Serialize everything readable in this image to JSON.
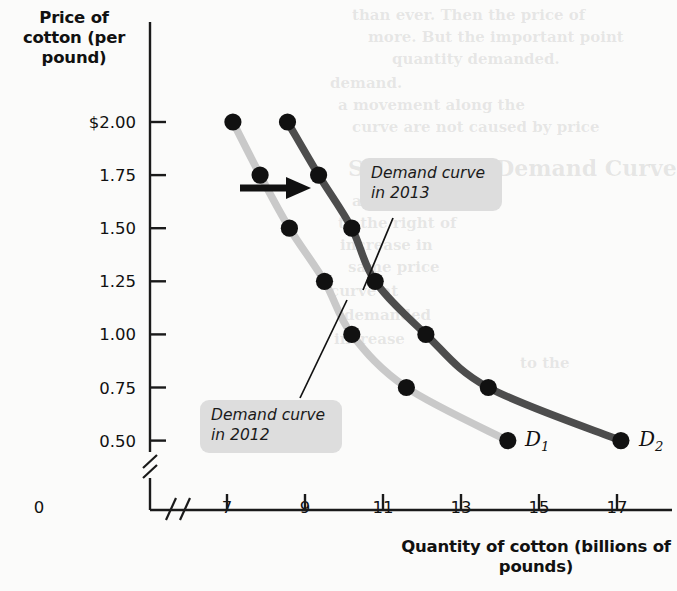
{
  "figure": {
    "y_axis_title": "Price of\ncotton\n(per pound)",
    "x_axis_title": "Quantity of cotton\n(billions of pounds)",
    "origin_label": "0"
  },
  "callouts": {
    "d2_label": "Demand curve\nin 2013",
    "d1_label": "Demand curve\nin 2012"
  },
  "curve_names": {
    "d1": "D",
    "d1_sub": "1",
    "d2": "D",
    "d2_sub": "2"
  },
  "colors": {
    "curve_2012": "#c9c9c9",
    "curve_2013": "#4d4d4d",
    "point": "#111111",
    "callout_bg": "#dddddd",
    "axis": "#1a1a1a",
    "page_bg": "#fbfbfa"
  },
  "ghost_text": [
    {
      "text": "than ever. Then the price of",
      "x": 352,
      "y": 6,
      "size": 15
    },
    {
      "text": "more. But the important point",
      "x": 368,
      "y": 28,
      "size": 15
    },
    {
      "text": "quantity demanded.",
      "x": 392,
      "y": 50,
      "size": 15
    },
    {
      "text": "demand.",
      "x": 330,
      "y": 74,
      "size": 15
    },
    {
      "text": "a movement along the",
      "x": 338,
      "y": 96,
      "size": 15
    },
    {
      "text": "curve are not caused by price",
      "x": 352,
      "y": 118,
      "size": 15
    },
    {
      "text": "Shift of the Demand Curve",
      "x": 348,
      "y": 155,
      "size": 22
    },
    {
      "text": "and the demand",
      "x": 352,
      "y": 192,
      "size": 15
    },
    {
      "text": "to the right of",
      "x": 338,
      "y": 214,
      "size": 15
    },
    {
      "text": "increase in",
      "x": 340,
      "y": 236,
      "size": 15
    },
    {
      "text": "same price",
      "x": 348,
      "y": 258,
      "size": 15
    },
    {
      "text": "curve at",
      "x": 330,
      "y": 282,
      "size": 15
    },
    {
      "text": "demanded",
      "x": 344,
      "y": 306,
      "size": 15
    },
    {
      "text": "increase",
      "x": 334,
      "y": 330,
      "size": 15
    },
    {
      "text": "to the",
      "x": 520,
      "y": 354,
      "size": 15
    }
  ],
  "chart_data": {
    "type": "line",
    "title": "",
    "xlabel": "Quantity of cotton (billions of pounds)",
    "ylabel": "Price of cotton (per pound)",
    "xlim": [
      6.3,
      17.8
    ],
    "ylim": [
      0.5,
      2.0
    ],
    "xticks": [
      7,
      9,
      11,
      13,
      15,
      17
    ],
    "xticklabels": [
      "7",
      "9",
      "11",
      "13",
      "15",
      "17"
    ],
    "yticks": [
      0.5,
      0.75,
      1.0,
      1.25,
      1.5,
      1.75,
      2.0
    ],
    "yticklabels": [
      "0.50",
      "0.75",
      "1.00",
      "1.25",
      "1.50",
      "1.75",
      "$2.00"
    ],
    "axis_break_x": true,
    "axis_break_y": true,
    "grid": false,
    "legend": "none",
    "annotations": [
      {
        "kind": "shift-arrow",
        "text": "",
        "from_x": 9.0,
        "to_x": 10.1,
        "y": 1.62
      }
    ],
    "series": [
      {
        "name": "Demand curve in 2012",
        "label": "D1",
        "color": "#c9c9c9",
        "x": [
          7.15,
          7.85,
          8.6,
          9.5,
          10.2,
          11.6,
          14.2
        ],
        "y": [
          2.0,
          1.75,
          1.5,
          1.25,
          1.0,
          0.75,
          0.5
        ]
      },
      {
        "name": "Demand curve in 2013",
        "label": "D2",
        "color": "#4d4d4d",
        "x": [
          8.55,
          9.35,
          10.2,
          10.8,
          12.1,
          13.7,
          17.1
        ],
        "y": [
          2.0,
          1.75,
          1.5,
          1.25,
          1.0,
          0.75,
          0.5
        ]
      }
    ]
  }
}
